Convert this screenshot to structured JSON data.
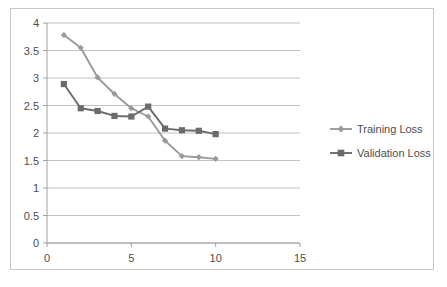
{
  "chart_data": {
    "type": "line",
    "title": "",
    "subtitle": "",
    "xlabel": "",
    "ylabel": "",
    "x": [
      1,
      2,
      3,
      4,
      5,
      6,
      7,
      8,
      9,
      10
    ],
    "xlim": [
      0,
      15
    ],
    "ylim": [
      0,
      4
    ],
    "grid": true,
    "grid_axis": "y",
    "legend_position": "right",
    "x_ticks": [
      "0",
      "5",
      "10",
      "15"
    ],
    "x_tick_values": [
      0,
      5,
      10,
      15
    ],
    "y_ticks": [
      "0",
      "0.5",
      "1",
      "1.5",
      "2",
      "2.5",
      "3",
      "3.5",
      "4"
    ],
    "y_tick_values": [
      0,
      0.5,
      1,
      1.5,
      2,
      2.5,
      3,
      3.5,
      4
    ],
    "series": [
      {
        "name": "Training Loss",
        "color": "#9a9a9a",
        "marker": "diamond",
        "values": [
          3.78,
          3.55,
          3.01,
          2.71,
          2.45,
          2.3,
          1.86,
          1.58,
          1.56,
          1.53
        ]
      },
      {
        "name": "Validation Loss",
        "color": "#6b6b6b",
        "marker": "square",
        "values": [
          2.89,
          2.45,
          2.4,
          2.31,
          2.3,
          2.48,
          2.08,
          2.05,
          2.04,
          1.98
        ]
      }
    ]
  },
  "legend": {
    "items": [
      {
        "label": "Training Loss"
      },
      {
        "label": "Validation Loss"
      }
    ]
  },
  "colors": {
    "training": "#9a9a9a",
    "validation": "#6b6b6b",
    "gridline": "#b3b3b3",
    "axis": "#959595",
    "text": "#4d4d4d",
    "frame_border": "#c8c8c8",
    "background": "#ffffff"
  }
}
